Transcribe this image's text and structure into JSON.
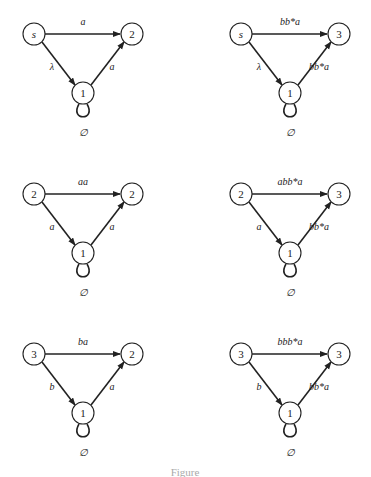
{
  "diagrams": [
    {
      "start": "s",
      "mid": "1",
      "end": "2",
      "top_edge": "a",
      "left_edge": "λ",
      "right_edge": "a",
      "loop": "∅"
    },
    {
      "start": "s",
      "mid": "1",
      "end": "3",
      "top_edge": "bb*a",
      "left_edge": "λ",
      "right_edge": "bb*a",
      "loop": "∅"
    },
    {
      "start": "2",
      "mid": "1",
      "end": "2",
      "top_edge": "aa",
      "left_edge": "a",
      "right_edge": "a",
      "loop": "∅"
    },
    {
      "start": "2",
      "mid": "1",
      "end": "3",
      "top_edge": "abb*a",
      "left_edge": "a",
      "right_edge": "bb*a",
      "loop": "∅"
    },
    {
      "start": "3",
      "mid": "1",
      "end": "2",
      "top_edge": "ba",
      "left_edge": "b",
      "right_edge": "a",
      "loop": "∅"
    },
    {
      "start": "3",
      "mid": "1",
      "end": "3",
      "top_edge": "bbb*a",
      "left_edge": "b",
      "right_edge": "bb*a",
      "loop": "∅"
    }
  ],
  "caption": "Figure"
}
